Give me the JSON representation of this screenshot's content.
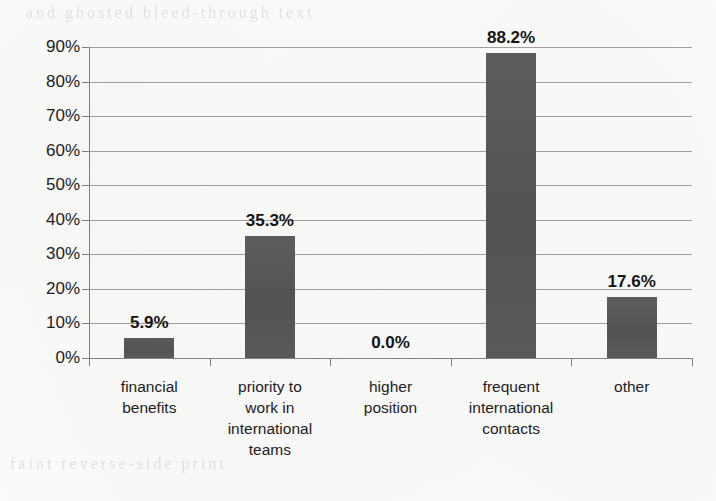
{
  "chart_data": {
    "type": "bar",
    "title": "",
    "subtitle": "",
    "xlabel": "",
    "ylabel": "",
    "categories": [
      "financial benefits",
      "priority to work in international teams",
      "higher position",
      "frequent international contacts",
      "other"
    ],
    "category_lines": [
      [
        "financial",
        "benefits"
      ],
      [
        "priority to",
        "work in",
        "international",
        "teams"
      ],
      [
        "higher",
        "position"
      ],
      [
        "frequent",
        "international",
        "contacts"
      ],
      [
        "other"
      ]
    ],
    "values": [
      5.9,
      35.3,
      0.0,
      88.2,
      17.6
    ],
    "value_labels": [
      "5.9%",
      "35.3%",
      "0.0%",
      "88.2%",
      "17.6%"
    ],
    "ylim": [
      0,
      90
    ],
    "ytick_labels": [
      "0%",
      "10%",
      "20%",
      "30%",
      "40%",
      "50%",
      "60%",
      "70%",
      "80%",
      "90%"
    ],
    "ytick_values": [
      0,
      10,
      20,
      30,
      40,
      50,
      60,
      70,
      80,
      90
    ],
    "grid": true,
    "grid_axis": "y",
    "legend": false,
    "legend_position": "none",
    "bar_color": "#575757",
    "gridline_color": "#8e8e8b",
    "label_color": "#141414",
    "background_color": "#fbfbfa"
  },
  "ghost_text": {
    "top": "and ghosted bleed-through text",
    "bottom_left": "faint reverse-side print"
  }
}
